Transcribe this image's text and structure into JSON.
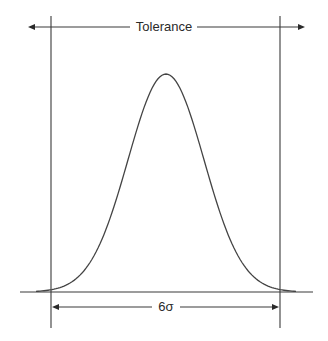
{
  "diagram": {
    "tolerance_label": "Tolerance",
    "sigma_label": "6σ",
    "colors": {
      "line": "#3a3a3a",
      "text": "#2a2a2a",
      "background": "#ffffff"
    }
  }
}
